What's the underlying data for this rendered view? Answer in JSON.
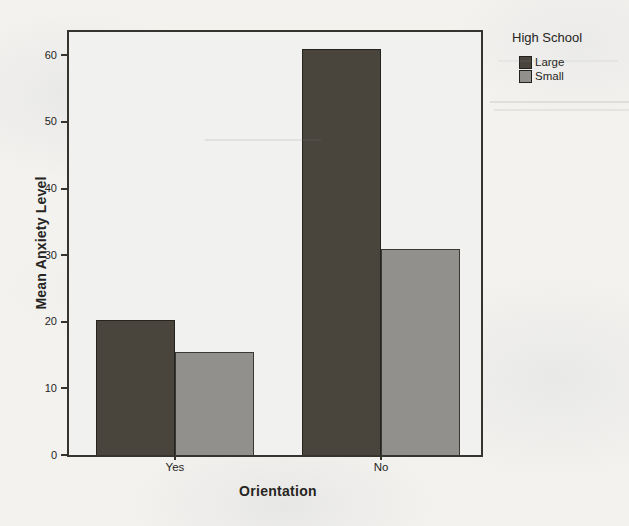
{
  "page": {
    "type": "scanned-statistics-chart"
  },
  "chart_data": {
    "type": "bar",
    "subtype": "clustered",
    "xlabel": "Orientation",
    "ylabel": "Mean Anxiety Level",
    "categories": [
      "Yes",
      "No"
    ],
    "series": [
      {
        "name": "Large",
        "values": [
          20.3,
          60.9
        ],
        "color": "#49453d",
        "border_color": "#26241f"
      },
      {
        "name": "Small",
        "values": [
          15.4,
          31.0
        ],
        "color": "#92908c",
        "border_color": "#3a3833"
      }
    ],
    "legend": {
      "title": "High School",
      "position": "top-right"
    },
    "ylim": [
      0,
      63.5
    ],
    "yticks": [
      0,
      10,
      20,
      30,
      40,
      50,
      60
    ],
    "grid": false,
    "plot_bg": "#f1f1ef",
    "frame_color": "#36342f",
    "paper_bg": "#f3f2ef"
  }
}
